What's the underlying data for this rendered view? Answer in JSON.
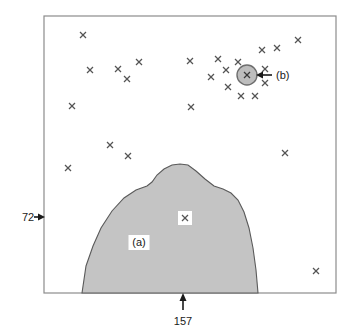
{
  "figure": {
    "title": "",
    "frame": {
      "x": 44,
      "y": 16,
      "width": 292,
      "height": 277,
      "border_color": "#8c8c8c"
    },
    "background_color": "#ffffff"
  },
  "annotations": {
    "left_callout": {
      "value": "72",
      "arrow": "right-arrow-icon",
      "text_x": 22,
      "text_y": 221,
      "arrow_x1": 32,
      "arrow_x2": 44,
      "arrow_y": 217
    },
    "bottom_callout": {
      "value": "157",
      "arrow": "up-arrow-icon",
      "text_x": 183,
      "text_y": 322,
      "arrow_y1": 310,
      "arrow_y2": 294,
      "arrow_x": 183
    },
    "region_label": {
      "text": "(a)",
      "x": 139,
      "y": 245,
      "box_fill": "#ffffff"
    },
    "point_label": {
      "text": "(b)",
      "x": 276,
      "y": 78,
      "arrow": "left-arrow-icon",
      "arrow_x1": 272,
      "arrow_x2": 256,
      "arrow_y": 75
    }
  },
  "chart_data": {
    "type": "scatter",
    "title": "",
    "xlabel": "",
    "ylabel": "",
    "grid": false,
    "legend": "none",
    "xlim": [
      44,
      336
    ],
    "ylim": [
      16,
      293
    ],
    "marker": "x",
    "marker_color": "#555555",
    "marker_size": 6,
    "points": [
      {
        "x": 83,
        "y": 35
      },
      {
        "x": 90,
        "y": 70
      },
      {
        "x": 118,
        "y": 69
      },
      {
        "x": 139,
        "y": 62
      },
      {
        "x": 127,
        "y": 79
      },
      {
        "x": 72,
        "y": 106
      },
      {
        "x": 110,
        "y": 145
      },
      {
        "x": 128,
        "y": 156
      },
      {
        "x": 68,
        "y": 168
      },
      {
        "x": 190,
        "y": 61
      },
      {
        "x": 191,
        "y": 107
      },
      {
        "x": 211,
        "y": 77
      },
      {
        "x": 218,
        "y": 59
      },
      {
        "x": 226,
        "y": 70
      },
      {
        "x": 228,
        "y": 87
      },
      {
        "x": 238,
        "y": 62
      },
      {
        "x": 241,
        "y": 96
      },
      {
        "x": 255,
        "y": 96
      },
      {
        "x": 262,
        "y": 50
      },
      {
        "x": 265,
        "y": 69
      },
      {
        "x": 265,
        "y": 83
      },
      {
        "x": 277,
        "y": 48
      },
      {
        "x": 298,
        "y": 40
      },
      {
        "x": 285,
        "y": 153
      },
      {
        "x": 316,
        "y": 271
      }
    ],
    "highlighted_point": {
      "x": 247,
      "y": 75,
      "circle_radius": 10,
      "circle_fill": "#bdbdbd",
      "circle_stroke": "#6e6e6e",
      "label": "(b)"
    },
    "interior_point": {
      "x": 185,
      "y": 218,
      "box_fill": "#ffffff",
      "label": ""
    },
    "region": {
      "name": "(a)",
      "fill": "#c4c4c4",
      "stroke": "#5a5a5a",
      "path": "M 82 293 L 86 266 L 93 246 L 101 228 L 112 211 L 124 198 L 136 190 L 147 186 L 152 182 L 157 175 L 164 169 L 172 165 L 180 164 L 188 165 L 196 171 L 205 179 L 214 186 L 223 189 L 231 193 L 238 200 L 244 212 L 249 228 L 253 248 L 256 270 L 258 293 Z"
    }
  }
}
